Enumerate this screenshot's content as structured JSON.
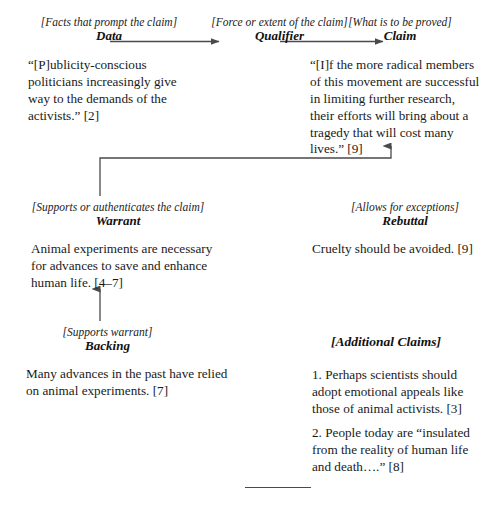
{
  "diagram": {
    "title_role_data": "Data",
    "title_role_qualifier": "Qualifier",
    "title_role_claim": "Claim",
    "title_role_warrant": "Warrant",
    "title_role_rebuttal": "Rebuttal",
    "title_role_backing": "Backing",
    "bracket_data": "[Facts that prompt the claim]",
    "bracket_qualifier": "[Force or extent of the claim]",
    "bracket_claim": "[What is to be proved]",
    "bracket_warrant": "[Supports or authenticates the claim]",
    "bracket_rebuttal": "[Allows for exceptions]",
    "bracket_backing": "[Supports warrant]",
    "text_data": "“[P]ublicity-conscious politicians increasingly give way to the demands of the activists.” [2]",
    "text_claim": "“[I]f the more radical members of this movement are successful in limiting further research, their efforts will bring about a tragedy that will cost many lives.” [9]",
    "text_warrant": "Animal experiments are necessary for advances to save and enhance human life. [4–7]",
    "text_rebuttal": "Cruelty should be avoided. [9]",
    "text_backing": "Many advances in the past have relied on animal experiments. [7]",
    "heading_additional_claims": "[Additional Claims]",
    "additional_claims": [
      "1. Perhaps scientists should adopt emotional appeals like those of animal activists. [3]",
      "2. People today are “insulated from the reality of human life and death….” [8]"
    ],
    "colors": {
      "line": "#4a4a4a",
      "text": "#1a1a1a",
      "background": "#ffffff"
    }
  }
}
